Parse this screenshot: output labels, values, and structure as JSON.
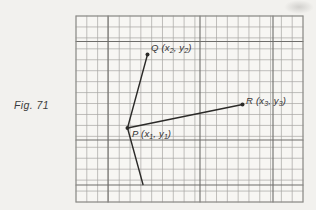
{
  "figure": {
    "caption": "Fig. 71",
    "labels": {
      "Q": {
        "pre": "Q (x",
        "sub1": "2",
        "mid": ", y",
        "sub2": "2",
        "post": ")"
      },
      "R": {
        "pre": "R (x",
        "sub1": "3",
        "mid": ", y",
        "sub2": "3",
        "post": ")"
      },
      "P": {
        "pre": "P (x",
        "sub1": "1",
        "mid": ", y",
        "sub2": "1",
        "post": ")"
      }
    },
    "colors": {
      "grid": "#a6a5a2",
      "grid_accent": "#6e6d6a",
      "grid_border": "#8c8b88",
      "line": "#2b2a28",
      "paper": "#f7f6f3",
      "text": "#333333"
    },
    "grid": {
      "left": 76,
      "top": 16,
      "right": 303,
      "bottom": 202,
      "cols": 21,
      "rows": 17,
      "accent_vertical_x": [
        108,
        200,
        273
      ],
      "accent_horizontal_y": [
        41.5,
        140,
        185
      ]
    },
    "points": {
      "P": {
        "x": 127.5,
        "y": 128
      },
      "Q": {
        "x": 147.5,
        "y": 54.5
      },
      "R": {
        "x": 242.5,
        "y": 104.5
      }
    },
    "segments": [
      {
        "from": "P",
        "to": "Q"
      },
      {
        "from": "P",
        "to": "R"
      },
      {
        "from": "P",
        "to_xy": [
          143,
          184.5
        ]
      }
    ]
  }
}
